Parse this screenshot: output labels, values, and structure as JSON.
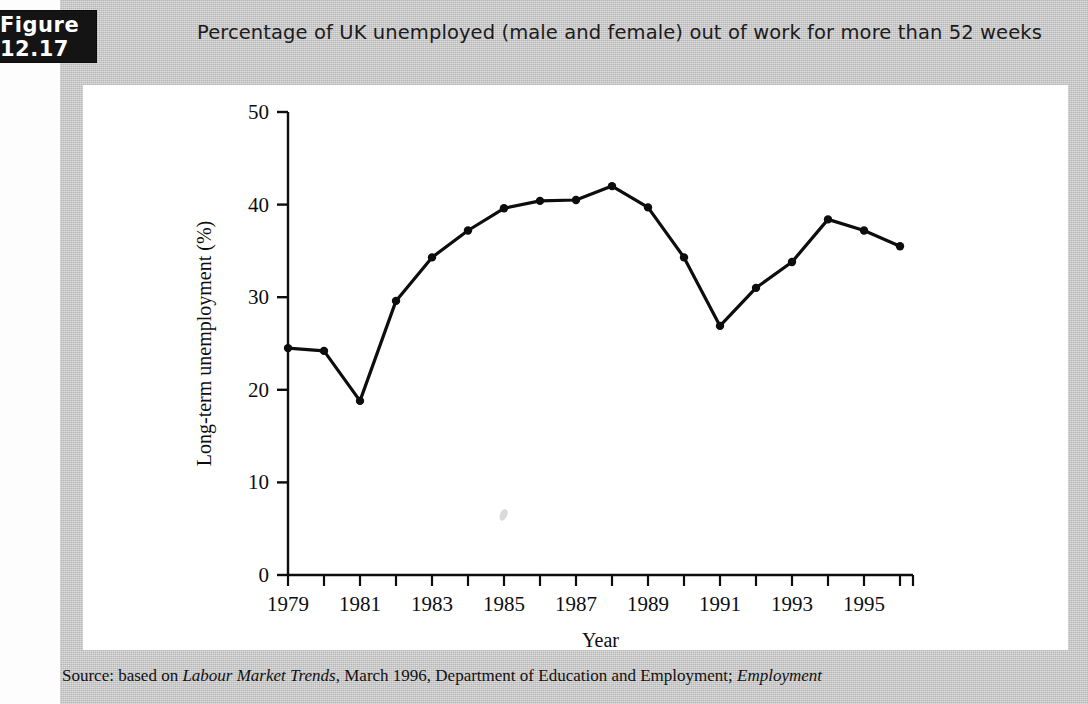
{
  "figure": {
    "badge_label": "Figure 12.17",
    "caption": "Percentage of UK unemployed (male and female) out of work for more than 52 weeks"
  },
  "source": {
    "prefix": "Source: based on ",
    "italic_1": "Labour Market Trends",
    "middle": ", March 1996, Department of Education and Employment; ",
    "italic_2": "Employment"
  },
  "colors": {
    "page_background": "#c9c9c9",
    "card_background": "#ffffff",
    "badge_background": "#141414",
    "badge_text": "#ffffff",
    "ink": "#0d0d0d"
  },
  "chart_data": {
    "type": "line",
    "title": "Percentage of UK unemployed (male and female) out of work for more than 52 weeks",
    "xlabel": "Year",
    "ylabel": "Long-term unemployment (%)",
    "xlim": [
      1979,
      1996
    ],
    "ylim": [
      0,
      50
    ],
    "yticks": [
      0,
      10,
      20,
      30,
      40,
      50
    ],
    "ytick_labels": [
      "0",
      "10",
      "20",
      "30",
      "40",
      "50"
    ],
    "xticks": [
      1979,
      1980,
      1981,
      1982,
      1983,
      1984,
      1985,
      1986,
      1987,
      1988,
      1989,
      1990,
      1991,
      1992,
      1993,
      1994,
      1995,
      1996
    ],
    "xtick_labels": [
      "1979",
      "",
      "1981",
      "",
      "1983",
      "",
      "1985",
      "",
      "1987",
      "",
      "1989",
      "",
      "1991",
      "",
      "1993",
      "",
      "1995",
      ""
    ],
    "grid": false,
    "legend": false,
    "marker": "filled-circle",
    "x": [
      1979,
      1980,
      1981,
      1982,
      1983,
      1984,
      1985,
      1986,
      1987,
      1988,
      1989,
      1990,
      1991,
      1992,
      1993,
      1994,
      1995,
      1996
    ],
    "values": [
      24.5,
      24.2,
      18.8,
      29.6,
      34.3,
      37.2,
      39.6,
      40.4,
      40.5,
      42.0,
      39.7,
      34.3,
      26.9,
      31.0,
      33.8,
      38.4,
      37.2,
      35.5
    ],
    "series": [
      {
        "name": "Long-term unemployment (%)",
        "values": [
          24.5,
          24.2,
          18.8,
          29.6,
          34.3,
          37.2,
          39.6,
          40.4,
          40.5,
          42.0,
          39.7,
          34.3,
          26.9,
          31.0,
          33.8,
          38.4,
          37.2,
          35.5
        ]
      }
    ]
  }
}
